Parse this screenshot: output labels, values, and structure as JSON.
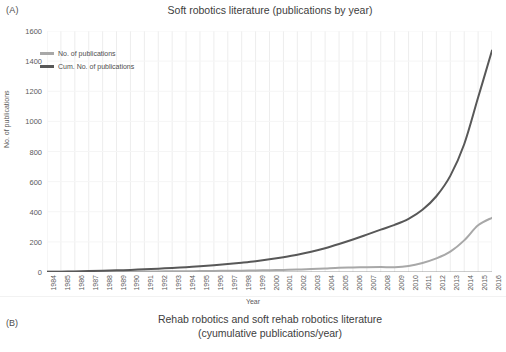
{
  "panels": {
    "a": {
      "label": "(A)",
      "title": "Soft robotics literature (publications by year)"
    },
    "b": {
      "label": "(B)",
      "title_line1": "Rehab robotics and soft rehab robotics literature",
      "title_line2": "(cyumulative publications/year)"
    }
  },
  "legend": {
    "items": [
      {
        "label": "No. of publications",
        "color": "#a8a8a8"
      },
      {
        "label": "Cum. No. of publications",
        "color": "#585858"
      }
    ]
  },
  "colors": {
    "annual_line": "#a8a8a8",
    "cumulative_line": "#585858",
    "grid": "#ededed",
    "axis": "#9a9a9a",
    "text": "#4d4d4d"
  },
  "chart_data": {
    "type": "line",
    "title": "Soft robotics literature (publications by year)",
    "xlabel": "Year",
    "ylabel": "No. of publications",
    "ylim": [
      0,
      1600
    ],
    "yticks": [
      0,
      200,
      400,
      600,
      800,
      1000,
      1200,
      1400,
      1600
    ],
    "grid": true,
    "legend_position": "top-left",
    "categories": [
      "1984",
      "1985",
      "1986",
      "1987",
      "1988",
      "1989",
      "1990",
      "1991",
      "1992",
      "1993",
      "1994",
      "1995",
      "1996",
      "1997",
      "1998",
      "1999",
      "2000",
      "2001",
      "2002",
      "2003",
      "2004",
      "2005",
      "2006",
      "2007",
      "2008",
      "2009",
      "2010",
      "2011",
      "2012",
      "2013",
      "2014",
      "2015",
      "2016"
    ],
    "series": [
      {
        "name": "No. of publications",
        "color": "#a8a8a8",
        "values": [
          1,
          1,
          2,
          2,
          2,
          3,
          3,
          4,
          4,
          5,
          5,
          6,
          7,
          8,
          9,
          10,
          12,
          14,
          16,
          20,
          24,
          28,
          30,
          32,
          33,
          32,
          40,
          60,
          90,
          135,
          210,
          310,
          360
        ]
      },
      {
        "name": "Cum. No. of publications",
        "color": "#585858",
        "values": [
          1,
          2,
          4,
          6,
          8,
          11,
          14,
          18,
          22,
          27,
          32,
          38,
          45,
          53,
          62,
          72,
          84,
          98,
          114,
          134,
          158,
          186,
          216,
          248,
          281,
          313,
          353,
          413,
          503,
          638,
          848,
          1158,
          1470
        ]
      }
    ]
  }
}
